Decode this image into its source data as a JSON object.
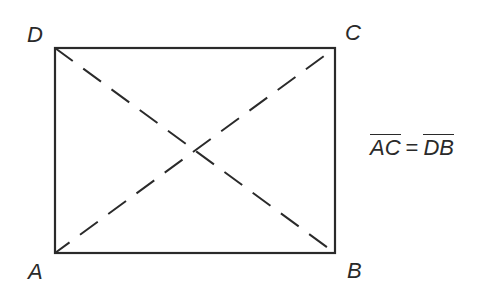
{
  "diagram": {
    "type": "rectangle-with-diagonals",
    "stroke_color": "#2a2a2a",
    "vertices": {
      "A": {
        "label": "A",
        "x": 55,
        "y": 253
      },
      "B": {
        "label": "B",
        "x": 335,
        "y": 253
      },
      "C": {
        "label": "C",
        "x": 335,
        "y": 48
      },
      "D": {
        "label": "D",
        "x": 55,
        "y": 48
      }
    },
    "sides": [
      "AB",
      "BC",
      "CD",
      "DA"
    ],
    "diagonals": [
      {
        "from": "A",
        "to": "C",
        "style": "dashed"
      },
      {
        "from": "D",
        "to": "B",
        "style": "dashed"
      }
    ]
  },
  "labels": {
    "A": "A",
    "B": "B",
    "C": "C",
    "D": "D"
  },
  "equation": {
    "left": "AC",
    "operator": "=",
    "right": "DB",
    "left_overline": true,
    "right_overline": true
  }
}
